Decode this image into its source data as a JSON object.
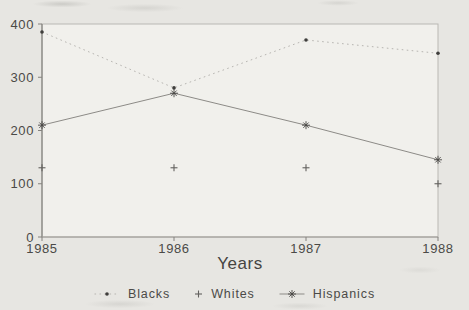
{
  "chart_data": {
    "type": "line",
    "title": "",
    "xlabel": "Years",
    "ylabel": "",
    "x": [
      1985,
      1986,
      1987,
      1988
    ],
    "x_tick_labels": [
      "1985",
      "1986",
      "1987",
      "1988"
    ],
    "y_ticks": [
      0,
      100,
      200,
      300,
      400
    ],
    "y_tick_labels": [
      "0",
      "100",
      "200",
      "300",
      "400"
    ],
    "ylim": [
      0,
      400
    ],
    "grid": false,
    "legend_position": "bottom-center",
    "series": [
      {
        "name": "Blacks",
        "values": [
          385,
          280,
          370,
          345
        ],
        "line_style": "dotted",
        "marker": "dot",
        "line_color": "#b7b5b1",
        "marker_color": "#3f3e3c"
      },
      {
        "name": "Whites",
        "values": [
          130,
          130,
          130,
          100
        ],
        "line_style": "none",
        "marker": "plus",
        "line_color": "none",
        "marker_color": "#63625f"
      },
      {
        "name": "Hispanics",
        "values": [
          210,
          270,
          210,
          145
        ],
        "line_style": "solid",
        "marker": "asterisk",
        "line_color": "#8d8b87",
        "marker_color": "#474644"
      }
    ]
  },
  "colors": {
    "page_background": "#e7e6e2",
    "plot_background": "#f1f0ec",
    "frame": "#bab8b3",
    "axis": "#84827e",
    "x_axis": "#9a9893",
    "text": "#4b4a47"
  }
}
